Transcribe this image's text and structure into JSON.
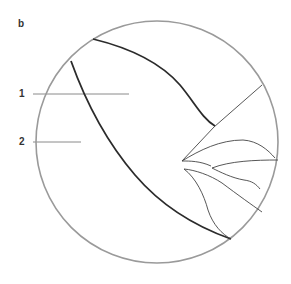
{
  "figure": {
    "panel_label": "b",
    "labels": [
      {
        "id": "1",
        "text": "1"
      },
      {
        "id": "2",
        "text": "2"
      }
    ],
    "colors": {
      "circle": "#9a9a9a",
      "heavy_line": "#2b2b2b",
      "thin_line": "#444444",
      "leader_line": "#8a8a8a"
    }
  }
}
